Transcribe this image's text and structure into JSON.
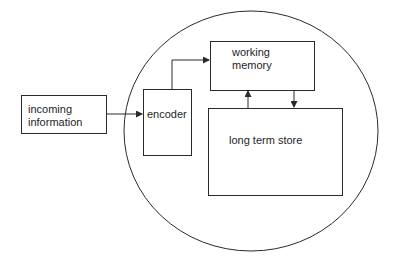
{
  "diagram": {
    "type": "memory-model",
    "boundary": {
      "shape": "ellipse",
      "label": ""
    },
    "nodes": {
      "incoming": {
        "label": "incoming\ninformation"
      },
      "encoder": {
        "label": "encoder"
      },
      "working_memory": {
        "label": "working\nmemory"
      },
      "long_term_store": {
        "label": "long term store"
      }
    },
    "edges": [
      {
        "from": "incoming information",
        "to": "encoder"
      },
      {
        "from": "encoder",
        "to": "working memory"
      },
      {
        "from": "long term store",
        "to": "working memory"
      },
      {
        "from": "working memory",
        "to": "long term store"
      }
    ],
    "colors": {
      "stroke": "#2a2a2a",
      "background": "#ffffff",
      "text": "#1e1e1e"
    }
  }
}
